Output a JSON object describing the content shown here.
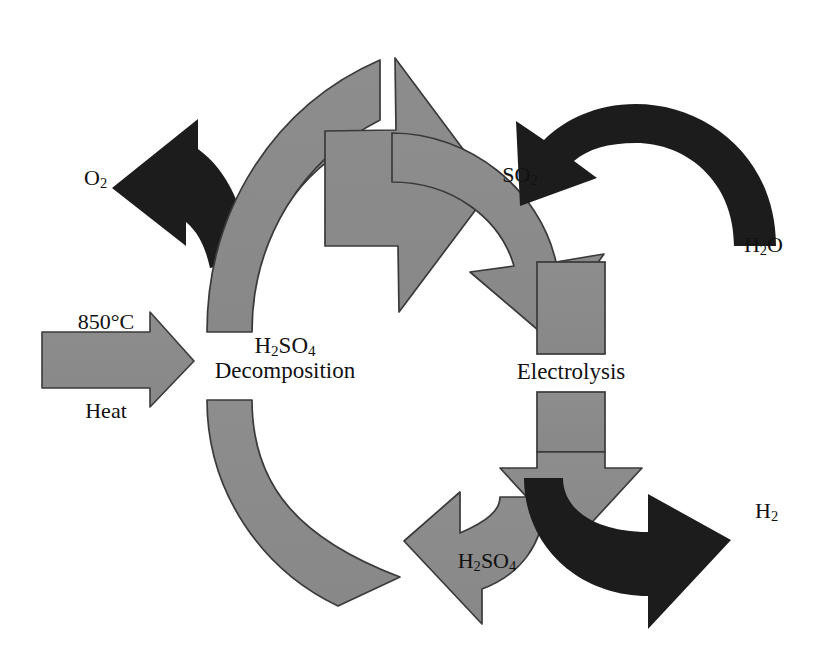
{
  "diagram": {
    "colors": {
      "gray_fill": "#8a8a8a",
      "gray_stroke": "#3a3a3a",
      "black_fill": "#1c1c1c",
      "background": "#ffffff",
      "text": "#111111"
    },
    "process_nodes": [
      {
        "id": "decomposition",
        "line1": "H",
        "sub1": "2",
        "line1b": "SO",
        "sub2": "4",
        "line2": "Decomposition",
        "label": "H2SO4 Decomposition"
      },
      {
        "id": "electrolysis",
        "label": "Electrolysis"
      }
    ],
    "labels": {
      "o2": {
        "text": "O",
        "sub": "2",
        "full": "O2"
      },
      "temperature": {
        "text": "850°C"
      },
      "heat": {
        "text": "Heat"
      },
      "decomposition_formula_pre": "H",
      "decomposition_formula_sub1": "2",
      "decomposition_formula_mid": "SO",
      "decomposition_formula_sub2": "4",
      "decomposition_word": "Decomposition",
      "so2": {
        "text": "SO",
        "sub": "2",
        "full": "SO2"
      },
      "h2o": {
        "pre": "H",
        "sub": "2",
        "post": "O",
        "full": "H2O"
      },
      "electrolysis": {
        "text": "Electrolysis"
      },
      "h2so4_bottom": {
        "pre": "H",
        "sub1": "2",
        "mid": "SO",
        "sub2": "4",
        "full": "H2SO4"
      },
      "h2": {
        "text": "H",
        "sub": "2",
        "full": "H2"
      }
    },
    "flows": [
      {
        "id": "heat-in",
        "from": "Heat 850°C",
        "to": "H2SO4 Decomposition",
        "color": "gray",
        "shape": "straight-right-arrow"
      },
      {
        "id": "o2-out",
        "from": "H2SO4 Decomposition",
        "to": "O2",
        "color": "black",
        "shape": "curved-left-arrow"
      },
      {
        "id": "so2-transfer",
        "from": "H2SO4 Decomposition",
        "to": "Electrolysis",
        "color": "gray",
        "shape": "curved-down-arrow",
        "species": "SO2"
      },
      {
        "id": "h2o-in",
        "from": "H2O",
        "to": "Electrolysis",
        "color": "black",
        "shape": "curved-down-left-arrow"
      },
      {
        "id": "electrolysis-down",
        "from": "Electrolysis",
        "to": "products",
        "color": "gray",
        "shape": "vertical-down-arrow"
      },
      {
        "id": "h2so4-return",
        "from": "Electrolysis",
        "to": "H2SO4 Decomposition",
        "color": "gray",
        "shape": "curved-left-arrow",
        "species": "H2SO4"
      },
      {
        "id": "h2-out",
        "from": "Electrolysis",
        "to": "H2",
        "color": "black",
        "shape": "curved-right-arrow"
      },
      {
        "id": "cycle-arc-upper",
        "from": "decomposition loop",
        "to": "SO2 arrowhead",
        "color": "gray",
        "shape": "arc-band"
      },
      {
        "id": "cycle-arc-lower",
        "from": "H2SO4 return",
        "to": "decomposition",
        "color": "gray",
        "shape": "arc-band"
      }
    ]
  }
}
